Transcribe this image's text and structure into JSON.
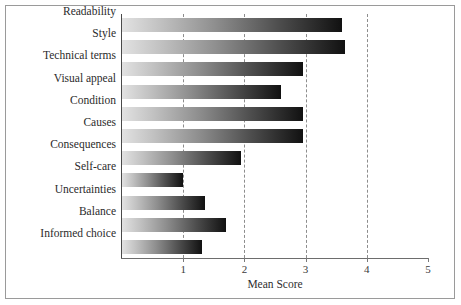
{
  "chart_data": {
    "type": "bar",
    "orientation": "horizontal",
    "title": "",
    "xlabel": "Mean Score",
    "ylabel": "",
    "xlim": [
      0,
      5
    ],
    "xticks": [
      1,
      2,
      3,
      4,
      5
    ],
    "grid": true,
    "legend": null,
    "categories": [
      "Readability",
      "Style",
      "Technical terms",
      "Visual appeal",
      "Condition",
      "Causes",
      "Consequences",
      "Self-care",
      "Uncertainties",
      "Balance",
      "Informed choice"
    ],
    "values": [
      3.6,
      3.65,
      2.95,
      2.6,
      2.95,
      2.95,
      1.95,
      1.0,
      1.35,
      1.7,
      1.3
    ],
    "bar_style": {
      "gradient_from": "#e2e2e2",
      "gradient_to": "#111111"
    }
  }
}
